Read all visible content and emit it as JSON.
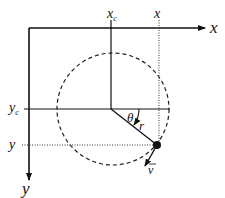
{
  "diagram": {
    "axes": {
      "x_label": "x",
      "y_label": "y"
    },
    "ticks": {
      "xc_label": "x",
      "xc_sub": "c",
      "x_label": "x",
      "yc_label": "y",
      "yc_sub": "c",
      "y_label": "y"
    },
    "annotations": {
      "angle": "θ",
      "radius": "r",
      "velocity": "v"
    },
    "colors": {
      "stroke": "#111111",
      "background": "#ffffff"
    }
  }
}
